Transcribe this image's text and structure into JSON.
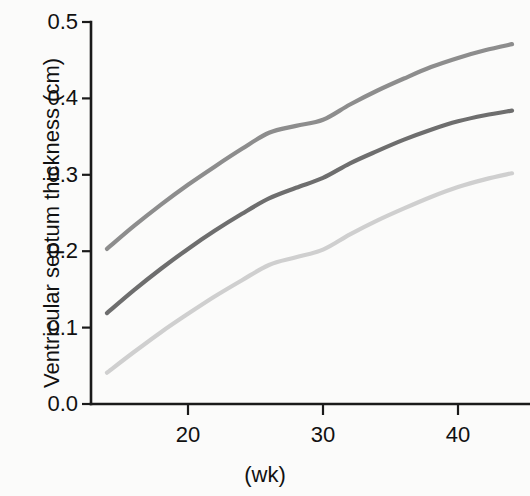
{
  "chart_data": {
    "type": "line",
    "title": "",
    "subtitle": "",
    "xlabel": "(wk)",
    "ylabel": "Ventricular septum thickness (cm)",
    "xlim": [
      13.5,
      44.5
    ],
    "ylim": [
      0.0,
      0.5
    ],
    "grid": false,
    "legend": "none",
    "x_tick_labels": [
      "20",
      "30",
      "40"
    ],
    "x_tick_values": [
      20,
      30,
      40
    ],
    "y_tick_labels": [
      "0.0",
      "0.1",
      "0.2",
      "0.3",
      "0.4",
      "0.5"
    ],
    "y_tick_values": [
      0.0,
      0.1,
      0.2,
      0.3,
      0.4,
      0.5
    ],
    "x": [
      14,
      16,
      18,
      20,
      22,
      24,
      26,
      28,
      30,
      32,
      34,
      36,
      38,
      40,
      42,
      44
    ],
    "series": [
      {
        "name": "upper-reference-curve",
        "color": "#8d8d8d",
        "values": [
          0.203,
          0.233,
          0.261,
          0.287,
          0.311,
          0.334,
          0.355,
          0.364,
          0.372,
          0.392,
          0.41,
          0.426,
          0.441,
          0.453,
          0.463,
          0.471
        ]
      },
      {
        "name": "middle-reference-curve",
        "color": "#6e6e6e",
        "values": [
          0.119,
          0.149,
          0.177,
          0.203,
          0.227,
          0.249,
          0.269,
          0.283,
          0.296,
          0.315,
          0.331,
          0.346,
          0.359,
          0.37,
          0.378,
          0.384
        ]
      },
      {
        "name": "lower-reference-curve",
        "color": "#cfcfcf",
        "values": [
          0.041,
          0.068,
          0.094,
          0.118,
          0.141,
          0.162,
          0.182,
          0.192,
          0.202,
          0.222,
          0.24,
          0.256,
          0.271,
          0.284,
          0.294,
          0.302
        ]
      }
    ]
  },
  "figure": {
    "background_color": "#fbfbfa",
    "axis_color": "#1a1a1a"
  }
}
